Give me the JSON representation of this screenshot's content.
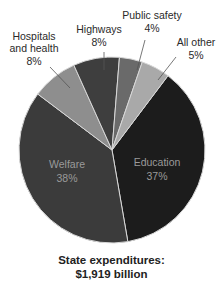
{
  "chart_data": {
    "type": "pie",
    "caption_line1": "State expenditures:",
    "caption_line2": "$1,919 billion",
    "slices": [
      {
        "label": "Education",
        "value": 37,
        "display": "37%",
        "color": "#1c1c1c"
      },
      {
        "label": "Welfare",
        "value": 38,
        "display": "38%",
        "color": "#3b3b3b"
      },
      {
        "label": "Hospitals and health",
        "value": 8,
        "display": "8%",
        "color": "#8e8e8e"
      },
      {
        "label": "Highways",
        "value": 8,
        "display": "8%",
        "color": "#3e3e3e"
      },
      {
        "label": "Public safety",
        "value": 4,
        "display": "4%",
        "color": "#6a6a6a"
      },
      {
        "label": "All other",
        "value": 5,
        "display": "5%",
        "color": "#a9a9a9"
      }
    ]
  },
  "labels": {
    "hospitals_l1": "Hospitals",
    "hospitals_l2": "and health",
    "hospitals_pct": "8%",
    "highways": "Highways",
    "highways_pct": "8%",
    "public_safety": "Public safety",
    "public_safety_pct": "4%",
    "all_other": "All other",
    "all_other_pct": "5%",
    "welfare": "Welfare",
    "welfare_pct": "38%",
    "education": "Education",
    "education_pct": "37%"
  }
}
